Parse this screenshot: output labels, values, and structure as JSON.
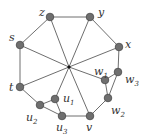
{
  "diagram": {
    "type": "graph",
    "colors": {
      "edge": "#6e6e6e",
      "node": "#6f6f6f",
      "label": "#333333"
    },
    "center": {
      "x": 69,
      "y": 67
    },
    "nodes": [
      {
        "id": "z",
        "label": "z",
        "sub": "",
        "x": 50,
        "y": 17,
        "lx": 39,
        "ly": 16
      },
      {
        "id": "y",
        "label": "y",
        "sub": "",
        "x": 90,
        "y": 17,
        "lx": 98,
        "ly": 16
      },
      {
        "id": "x",
        "label": "x",
        "sub": "",
        "x": 119,
        "y": 47,
        "lx": 125,
        "ly": 48
      },
      {
        "id": "s",
        "label": "s",
        "sub": "",
        "x": 20,
        "y": 45,
        "lx": 9,
        "ly": 41
      },
      {
        "id": "t",
        "label": "t",
        "sub": "",
        "x": 20,
        "y": 87,
        "lx": 9,
        "ly": 91
      },
      {
        "id": "w1",
        "label": "w",
        "sub": "1",
        "x": 105,
        "y": 80,
        "lx": 94,
        "ly": 75
      },
      {
        "id": "w3",
        "label": "w",
        "sub": "3",
        "x": 118,
        "y": 72,
        "lx": 125,
        "ly": 83
      },
      {
        "id": "w2",
        "label": "w",
        "sub": "2",
        "x": 108,
        "y": 98,
        "lx": 111,
        "ly": 114
      },
      {
        "id": "v",
        "label": "v",
        "sub": "",
        "x": 90,
        "y": 116,
        "lx": 86,
        "ly": 131
      },
      {
        "id": "u3",
        "label": "u",
        "sub": "3",
        "x": 62,
        "y": 116,
        "lx": 56,
        "ly": 131
      },
      {
        "id": "u1",
        "label": "u",
        "sub": "1",
        "x": 55,
        "y": 99,
        "lx": 63,
        "ly": 102
      },
      {
        "id": "u2",
        "label": "u",
        "sub": "2",
        "x": 40,
        "y": 105,
        "lx": 26,
        "ly": 121
      }
    ],
    "edges": [
      [
        "z",
        "y"
      ],
      [
        "y",
        "x"
      ],
      [
        "z",
        "s"
      ],
      [
        "s",
        "t"
      ],
      [
        "t",
        "u2"
      ],
      [
        "u2",
        "u1"
      ],
      [
        "u2",
        "u3"
      ],
      [
        "u1",
        "u3"
      ],
      [
        "u3",
        "v"
      ],
      [
        "v",
        "w2"
      ],
      [
        "w2",
        "w1"
      ],
      [
        "w2",
        "w3"
      ],
      [
        "w1",
        "w3"
      ],
      [
        "w3",
        "x"
      ]
    ],
    "spokes": [
      "z",
      "y",
      "x",
      "s",
      "t",
      "w1",
      "v",
      "u1"
    ]
  }
}
